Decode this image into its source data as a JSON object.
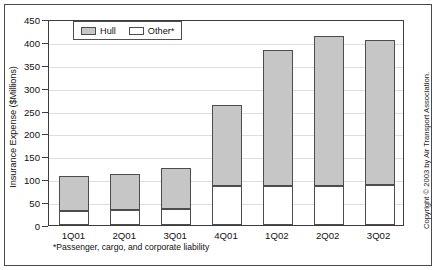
{
  "chart_data": {
    "type": "bar",
    "stacked": true,
    "title": "",
    "xlabel": "",
    "ylabel": "Insurance Expense ($Millions)",
    "categories": [
      "1Q01",
      "2Q01",
      "3Q01",
      "4Q01",
      "1Q02",
      "2Q02",
      "3Q02"
    ],
    "series": [
      {
        "name": "Other*",
        "values": [
          31,
          33,
          35,
          86,
          86,
          86,
          88
        ],
        "color": "#ffffff"
      },
      {
        "name": "Hull",
        "values": [
          75,
          79,
          89,
          177,
          296,
          327,
          317
        ],
        "color": "#c6c6c6"
      }
    ],
    "totals": [
      106,
      112,
      124,
      263,
      382,
      413,
      405
    ],
    "ylim": [
      0,
      450
    ],
    "ytick_labels": [
      "0",
      "50",
      "100",
      "150",
      "200",
      "250",
      "300",
      "350",
      "400",
      "450"
    ],
    "ytick_values": [
      0,
      50,
      100,
      150,
      200,
      250,
      300,
      350,
      400,
      450
    ],
    "grid": true,
    "legend_position": "top-left",
    "legend_entries": [
      "Hull",
      "Other*"
    ]
  },
  "figure": {
    "ylabel": "Insurance Expense ($Millions)",
    "footnote": "*Passenger, cargo, and corporate liability",
    "copyright": "Copyright © 2003 by Air Transport Association."
  },
  "legend": {
    "hull_label": "Hull",
    "other_label": "Other*"
  }
}
